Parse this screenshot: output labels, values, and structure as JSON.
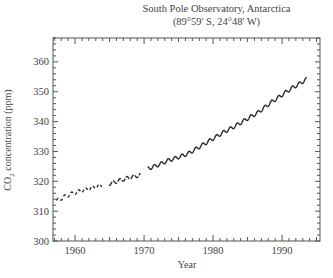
{
  "chart_data": {
    "type": "line",
    "title": "South Pole Observatory, Antarctica",
    "subtitle": "(89°59' S, 24°48' W)",
    "xlabel": "Year",
    "ylabel_main": "CO",
    "ylabel_sub": "2",
    "ylabel_rest": " concentration (ppm)",
    "ylabel": "CO2 concentration (ppm)",
    "xlim": [
      1956.8,
      1995.5
    ],
    "ylim": [
      300,
      368
    ],
    "xticks": [
      1960,
      1970,
      1980,
      1990
    ],
    "yticks": [
      300,
      310,
      320,
      330,
      340,
      350,
      360
    ],
    "grid": false,
    "legend": null,
    "seasonal_amplitude_ppm": 0.6,
    "series": [
      {
        "name": "CO2 (segment 1)",
        "style": "dashed-sparse",
        "x": [
          1957.3,
          1958.0,
          1959.0,
          1960.0,
          1961.0,
          1962.0,
          1963.0,
          1963.9
        ],
        "y": [
          313.4,
          314.3,
          315.4,
          316.2,
          316.9,
          317.5,
          318.2,
          318.6
        ]
      },
      {
        "name": "CO2 (segment 2)",
        "style": "dashed",
        "x": [
          1964.9,
          1965.5,
          1966.5,
          1967.5,
          1968.5,
          1969.5
        ],
        "y": [
          319.2,
          319.5,
          320.3,
          321.0,
          321.6,
          322.1
        ]
      },
      {
        "name": "CO2 (segment 3)",
        "style": "solid",
        "x": [
          1970.5,
          1971.5,
          1972.5,
          1973.5,
          1974.5,
          1975.5,
          1976.5,
          1977.5,
          1978.5,
          1979.5,
          1980.5,
          1981.5,
          1982.5,
          1983.5,
          1984.5,
          1985.5,
          1986.5,
          1987.5,
          1988.5,
          1989.5,
          1990.5,
          1991.5,
          1992.5,
          1993.6
        ],
        "y": [
          324.2,
          325.0,
          325.9,
          327.0,
          327.7,
          328.5,
          329.4,
          330.8,
          332.2,
          333.6,
          335.0,
          336.4,
          337.6,
          338.9,
          340.3,
          341.7,
          343.0,
          344.8,
          346.6,
          348.1,
          349.8,
          351.3,
          352.6,
          354.3
        ]
      }
    ]
  }
}
